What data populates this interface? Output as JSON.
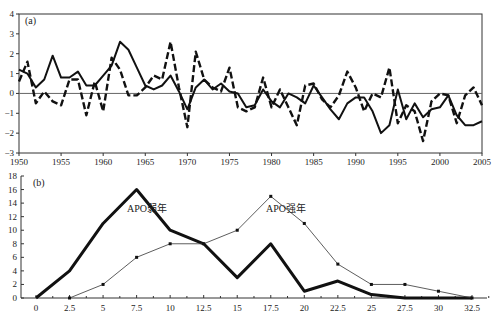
{
  "chart_data": [
    {
      "type": "line",
      "panel_label": "(a)",
      "title": "",
      "xlabel": "",
      "ylabel": "",
      "xlim": [
        1950,
        2005
      ],
      "ylim": [
        -3,
        4
      ],
      "x_ticks": [
        1950,
        1955,
        1960,
        1965,
        1970,
        1975,
        1980,
        1985,
        1990,
        1995,
        2000,
        2005
      ],
      "y_ticks": [
        -3,
        -2,
        -1,
        0,
        1,
        2,
        3,
        4
      ],
      "zero_line": true,
      "x": [
        1950,
        1951,
        1952,
        1953,
        1954,
        1955,
        1956,
        1957,
        1958,
        1959,
        1960,
        1961,
        1962,
        1963,
        1964,
        1965,
        1966,
        1967,
        1968,
        1969,
        1970,
        1971,
        1972,
        1973,
        1974,
        1975,
        1976,
        1977,
        1978,
        1979,
        1980,
        1981,
        1982,
        1983,
        1984,
        1985,
        1986,
        1987,
        1988,
        1989,
        1990,
        1991,
        1992,
        1993,
        1994,
        1995,
        1996,
        1997,
        1998,
        1999,
        2000,
        2001,
        2002,
        2003,
        2004,
        2005
      ],
      "series": [
        {
          "name": "solid",
          "style": "solid",
          "values": [
            1.2,
            1.0,
            0.3,
            0.7,
            1.9,
            0.8,
            0.8,
            1.1,
            0.4,
            0.4,
            0.9,
            1.4,
            2.6,
            2.2,
            1.3,
            0.4,
            0.2,
            0.4,
            0.9,
            0.1,
            -0.8,
            0.3,
            0.7,
            0.2,
            0.5,
            0.1,
            0.0,
            -0.7,
            -0.6,
            0.2,
            -0.4,
            -0.7,
            0.0,
            -0.2,
            -0.5,
            0.4,
            -0.2,
            -0.8,
            -1.3,
            -0.5,
            -0.2,
            -0.2,
            -0.9,
            -2.0,
            -1.6,
            0.2,
            -1.3,
            -0.5,
            -1.2,
            -0.8,
            -0.7,
            -0.1,
            -1.1,
            -1.6,
            -1.6,
            -1.4
          ]
        },
        {
          "name": "dashed",
          "style": "dashed",
          "values": [
            0.6,
            1.6,
            -0.5,
            0.1,
            -0.4,
            -0.6,
            0.7,
            0.7,
            -1.1,
            0.6,
            -0.9,
            1.8,
            1.2,
            -0.1,
            -0.1,
            0.3,
            0.9,
            0.7,
            2.6,
            0.3,
            -1.7,
            2.1,
            0.7,
            0.3,
            0.1,
            1.3,
            -0.7,
            -0.9,
            -0.7,
            0.8,
            -0.7,
            0.2,
            -0.7,
            -1.6,
            0.4,
            0.5,
            -0.3,
            -0.7,
            -0.1,
            1.1,
            0.3,
            -0.9,
            0.0,
            -0.2,
            1.3,
            -1.5,
            -0.6,
            -0.9,
            -2.4,
            -0.4,
            0.0,
            -0.1,
            -1.5,
            -0.1,
            0.3,
            -0.6
          ]
        }
      ]
    },
    {
      "type": "line",
      "panel_label": "(b)",
      "title": "",
      "xlabel": "",
      "ylabel": "",
      "xlim": [
        0,
        32.5
      ],
      "ylim": [
        0,
        18
      ],
      "x_ticks": [
        "0",
        "2.5",
        "5",
        "7.5",
        "10",
        "12.5",
        "15",
        "17.5",
        "20",
        "22.5",
        "25",
        "27.5",
        "30",
        "32.5"
      ],
      "y_ticks": [
        0,
        2,
        4,
        6,
        8,
        10,
        12,
        14,
        16,
        18
      ],
      "series": [
        {
          "name": "APO弱年",
          "style": "thick",
          "x": [
            0,
            2.5,
            5,
            7.5,
            10,
            12.5,
            15,
            17.5,
            20,
            22.5,
            25,
            27.5,
            30,
            32.5
          ],
          "values": [
            0,
            4,
            11,
            16,
            10,
            8,
            3,
            8,
            1,
            2.5,
            0.5,
            0,
            0,
            0
          ]
        },
        {
          "name": "APO强年",
          "style": "thin-marker",
          "x": [
            2.5,
            5,
            7.5,
            10,
            12.5,
            15,
            17.5,
            20,
            22.5,
            25,
            27.5,
            30,
            32.5
          ],
          "values": [
            0,
            2,
            6,
            8,
            8,
            10,
            15,
            11,
            5,
            2,
            2,
            1,
            0
          ]
        }
      ],
      "annotations": [
        {
          "text": "APO弱年",
          "near_x": 7.5,
          "near_y": 13.5
        },
        {
          "text": "APO强年",
          "near_x": 17.5,
          "near_y": 13.5
        }
      ]
    }
  ],
  "labels": {
    "panel_a": "(a)",
    "panel_b": "(b)",
    "weak_year": "APO弱年",
    "strong_year": "APO强年"
  }
}
